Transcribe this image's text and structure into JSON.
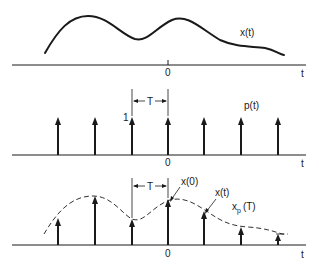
{
  "figure": {
    "panels": [
      {
        "id": "continuous-signal",
        "signal_label": "x(t)",
        "axis_label": "t",
        "origin_label": "0"
      },
      {
        "id": "impulse-train",
        "signal_label": "p(t)",
        "axis_label": "t",
        "origin_label": "0",
        "impulse_height_label": "1",
        "period_label": "T"
      },
      {
        "id": "sampled-signal",
        "signal_label": "x",
        "signal_subscript": "p",
        "signal_suffix": "(T)",
        "axis_label": "t",
        "origin_label": "0",
        "period_label": "T",
        "annotations": [
          "x(0)",
          "x(t)"
        ]
      }
    ],
    "impulse_positions_px": [
      58,
      95,
      132,
      168,
      204,
      241,
      278
    ],
    "sampled_heights_px": [
      197,
      177,
      200,
      181,
      195,
      222,
      233
    ]
  }
}
